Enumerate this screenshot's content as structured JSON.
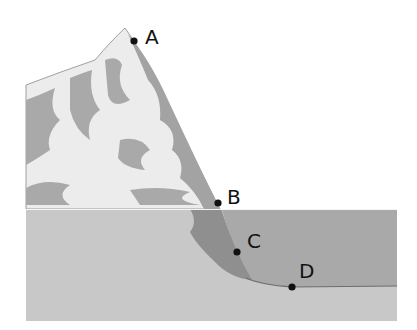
{
  "figure": {
    "colors": {
      "snow": "#ececec",
      "rock": "#a9a9a9",
      "shadow_rock": "#9a9a9a",
      "water_upper": "#a8a8a8",
      "water_lower": "#c9c9c9",
      "underwater_slope": "#8e8e8e",
      "waterline": "#f4f4f4",
      "point": "#111111"
    },
    "points": [
      {
        "id": "A",
        "label": "A",
        "x": 134,
        "y": 41
      },
      {
        "id": "B",
        "label": "B",
        "x": 218,
        "y": 203
      },
      {
        "id": "C",
        "label": "C",
        "x": 237,
        "y": 252
      },
      {
        "id": "D",
        "label": "D",
        "x": 292,
        "y": 287
      }
    ]
  }
}
